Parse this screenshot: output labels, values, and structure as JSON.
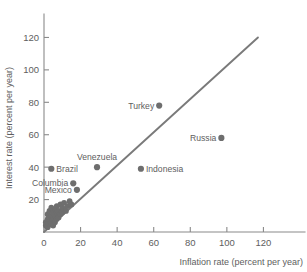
{
  "chart_data": {
    "type": "scatter",
    "title": "",
    "xlabel": "Inflation rate (percent per year)",
    "ylabel": "Interest rate (percent per year)",
    "xlim": [
      0,
      140
    ],
    "ylim": [
      0,
      132
    ],
    "xticks": [
      0,
      20,
      40,
      60,
      80,
      100,
      120
    ],
    "xtick_labels": [
      "0",
      "20",
      "40",
      "60",
      "80",
      "100",
      "120"
    ],
    "yticks": [
      20,
      40,
      60,
      80,
      100,
      120
    ],
    "ytick_labels": [
      "20",
      "40",
      "60",
      "80",
      "100",
      "120"
    ],
    "grid": false,
    "legend": "none",
    "marker_color": "#6e6e6e",
    "line_color": "#7a7a7a",
    "axis_color": "#8a8a8a",
    "text_color": "#5e5e5e",
    "fit_line": {
      "name": "45-degree reference line",
      "x_start": 0,
      "y_start": 0,
      "x_end": 117,
      "y_end": 120
    },
    "labeled_points": [
      {
        "label": "Turkey",
        "x": 63,
        "y": 78,
        "label_side": "left"
      },
      {
        "label": "Russia",
        "x": 97,
        "y": 58,
        "label_side": "left"
      },
      {
        "label": "Indonesia",
        "x": 53,
        "y": 39,
        "label_side": "right"
      },
      {
        "label": "Venezuela",
        "x": 29,
        "y": 40,
        "label_side": "above"
      },
      {
        "label": "Brazil",
        "x": 4,
        "y": 39,
        "label_side": "right"
      },
      {
        "label": "Columbia",
        "x": 16,
        "y": 30,
        "label_side": "left"
      },
      {
        "label": "Mexico",
        "x": 18,
        "y": 26,
        "label_side": "left"
      }
    ],
    "unlabeled_points": [
      {
        "x": 1,
        "y": 4
      },
      {
        "x": 1,
        "y": 6
      },
      {
        "x": 2,
        "y": 3
      },
      {
        "x": 2,
        "y": 8
      },
      {
        "x": 2,
        "y": 11
      },
      {
        "x": 3,
        "y": 5
      },
      {
        "x": 3,
        "y": 9
      },
      {
        "x": 3,
        "y": 13
      },
      {
        "x": 4,
        "y": 6
      },
      {
        "x": 4,
        "y": 10
      },
      {
        "x": 4,
        "y": 15
      },
      {
        "x": 5,
        "y": 4
      },
      {
        "x": 5,
        "y": 8
      },
      {
        "x": 5,
        "y": 12
      },
      {
        "x": 6,
        "y": 6
      },
      {
        "x": 6,
        "y": 10
      },
      {
        "x": 6,
        "y": 14
      },
      {
        "x": 7,
        "y": 8
      },
      {
        "x": 7,
        "y": 12
      },
      {
        "x": 7,
        "y": 16
      },
      {
        "x": 8,
        "y": 9
      },
      {
        "x": 8,
        "y": 13
      },
      {
        "x": 9,
        "y": 11
      },
      {
        "x": 9,
        "y": 17
      },
      {
        "x": 10,
        "y": 12
      },
      {
        "x": 10,
        "y": 15
      },
      {
        "x": 11,
        "y": 14
      },
      {
        "x": 11,
        "y": 18
      },
      {
        "x": 12,
        "y": 13
      },
      {
        "x": 13,
        "y": 16
      },
      {
        "x": 14,
        "y": 19
      },
      {
        "x": 15,
        "y": 17
      }
    ]
  }
}
